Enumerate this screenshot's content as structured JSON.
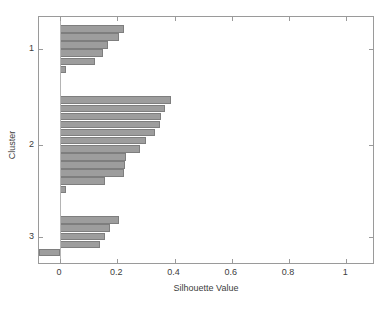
{
  "chart_data": {
    "type": "bar",
    "orientation": "horizontal",
    "title": "",
    "xlabel": "Silhouette Value",
    "ylabel": "Cluster",
    "xlim": [
      -0.0734,
      1.1
    ],
    "xticks": [
      0,
      0.2,
      0.4,
      0.6,
      0.8,
      1
    ],
    "xticklabels": [
      "0",
      "0.2",
      "0.4",
      "0.6",
      "0.8",
      "1"
    ],
    "yticks": [
      1,
      2,
      3
    ],
    "yticklabels": [
      "1",
      "2",
      "3"
    ],
    "grid": false,
    "legend": null,
    "bar_color": "#9d9d9d",
    "bar_edge_color": "#7e7e7e",
    "axis_color": "#9a9a9a",
    "text_color": "#3d3d3d",
    "background": "#ffffff",
    "clusters": [
      {
        "label": "1",
        "values": [
          0.225,
          0.205,
          0.166,
          0.15,
          0.123,
          0.022
        ]
      },
      {
        "label": "2",
        "values": [
          0.386,
          0.366,
          0.353,
          0.348,
          0.333,
          0.3,
          0.278,
          0.229,
          0.226,
          0.222,
          0.158,
          0.02
        ]
      },
      {
        "label": "3",
        "values": [
          0.205,
          0.173,
          0.158,
          0.139,
          -0.072
        ]
      }
    ]
  }
}
